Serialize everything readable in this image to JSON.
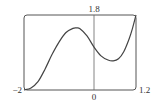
{
  "chart_data": {
    "type": "line",
    "title": "",
    "xlabel": "",
    "ylabel": "",
    "xlim": [
      -2,
      1.2
    ],
    "ylim": [
      0,
      1.8
    ],
    "grid": false,
    "legend": null,
    "tick_labels": {
      "x_min": "−2",
      "x_zero": "0",
      "x_max": "1.2",
      "y_max": "1.8"
    },
    "series": [
      {
        "name": "f(x)",
        "x": [
          -2.0,
          -1.8,
          -1.6,
          -1.4,
          -1.2,
          -1.0,
          -0.8,
          -0.6,
          -0.5,
          -0.4,
          -0.2,
          0.0,
          0.2,
          0.4,
          0.55,
          0.7,
          0.85,
          1.0,
          1.1,
          1.2
        ],
        "y": [
          0.0,
          0.05,
          0.2,
          0.5,
          0.85,
          1.15,
          1.38,
          1.48,
          1.49,
          1.47,
          1.3,
          1.03,
          0.82,
          0.72,
          0.7,
          0.75,
          0.92,
          1.22,
          1.48,
          1.8
        ]
      }
    ],
    "annotations": {
      "peak": {
        "x": -0.5,
        "y": 1.49
      },
      "y_intercept": {
        "x": 0,
        "y": 1.03
      },
      "trough": {
        "x": 0.55,
        "y": 0.7
      }
    }
  },
  "style": {
    "frame_color": "#555555",
    "curve_color": "#444444",
    "axis_color": "#666666"
  }
}
